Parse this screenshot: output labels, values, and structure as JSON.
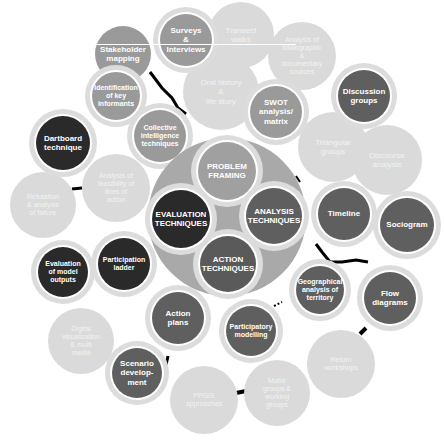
{
  "diagram": {
    "title": "",
    "center_hub": {
      "color": "#a9a9a9",
      "core": [
        {
          "id": "problem",
          "label": "PROBLEM\nFRAMING",
          "color": "#a0a0a0"
        },
        {
          "id": "analysis",
          "label": "ANALYSIS\nTECHNIQUES",
          "color": "#5f5f5f"
        },
        {
          "id": "action",
          "label": "ACTION\nTECHNIQUES",
          "color": "#5a5a5a"
        },
        {
          "id": "evaluation",
          "label": "EVALUATION\nTECHNIQUES",
          "color": "#2a2a2a"
        }
      ]
    },
    "techniques": [
      {
        "id": "surveys",
        "label": "Surveys\n&\nInterviews",
        "shade": "mid"
      },
      {
        "id": "transect",
        "label": "Transect\nwalks",
        "shade": "light"
      },
      {
        "id": "bibliographic",
        "label": "Analysis of\nbibliographic\n&\ndocumentary\nsources",
        "shade": "light"
      },
      {
        "id": "stakeholder",
        "label": "Stakeholder\nmapping",
        "shade": "mid"
      },
      {
        "id": "key-informants",
        "label": "Identification\nof key\ninformants",
        "shade": "mid"
      },
      {
        "id": "oral-history",
        "label": "Oral history\n&\nlife story",
        "shade": "light"
      },
      {
        "id": "swot",
        "label": "SWOT\nanalysis/\nmatrix",
        "shade": "mid"
      },
      {
        "id": "discussion",
        "label": "Discussion\ngroups",
        "shade": "dark"
      },
      {
        "id": "collective",
        "label": "Collective\nintelligence\ntechniques",
        "shade": "mid"
      },
      {
        "id": "triangular",
        "label": "Triangular\ngroups",
        "shade": "light"
      },
      {
        "id": "discourse",
        "label": "Discourse\nanalysis",
        "shade": "light"
      },
      {
        "id": "dartboard",
        "label": "Dartboard\ntechnique",
        "shade": "black"
      },
      {
        "id": "feasibility",
        "label": "Analysis of\nfeasibility of\nlines of\naction",
        "shade": "light"
      },
      {
        "id": "refutation",
        "label": "Refutation\n& analysis\nof failure",
        "shade": "light"
      },
      {
        "id": "timeline",
        "label": "Timeline",
        "shade": "dark"
      },
      {
        "id": "sociogram",
        "label": "Sociogram",
        "shade": "dark"
      },
      {
        "id": "eval-model",
        "label": "Evaluation\nof model\noutputs",
        "shade": "black"
      },
      {
        "id": "participation-ladder",
        "label": "Participation\nladder",
        "shade": "black"
      },
      {
        "id": "geographical",
        "label": "Geographical\nanalysis of\nterritory",
        "shade": "dark"
      },
      {
        "id": "flow",
        "label": "Flow\ndiagrams",
        "shade": "dark"
      },
      {
        "id": "action-plans",
        "label": "Action\nplans",
        "shade": "dark"
      },
      {
        "id": "participatory-modelling",
        "label": "Participatory\nmodelling",
        "shade": "dark"
      },
      {
        "id": "digital",
        "label": "Digital\nvisualization\n& multi\nmedia",
        "shade": "light"
      },
      {
        "id": "scenario",
        "label": "Scenario\ndevelop-\nment",
        "shade": "dark"
      },
      {
        "id": "return",
        "label": "Return\nworkshops",
        "shade": "light"
      },
      {
        "id": "ppgis",
        "label": "PPGIS\napproaches",
        "shade": "light"
      },
      {
        "id": "motor",
        "label": "Motor\ngroups &\nworking\ngroups",
        "shade": "light"
      }
    ],
    "colors": {
      "black": "#2a2a2a",
      "dark": "#5f5f5f",
      "mid": "#9a9a9a",
      "light": "#dadada",
      "ring": "#dcdcdc",
      "connector": "#000000"
    }
  }
}
